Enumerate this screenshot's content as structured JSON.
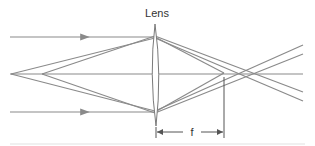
{
  "diagram": {
    "lens_label": "Lens",
    "focal_label": "f",
    "colors": {
      "ray": "#8a8a8a",
      "lens": "#7a7a7a",
      "dimension": "#555555",
      "text": "#333333",
      "baseline": "#e2e2e2"
    }
  }
}
